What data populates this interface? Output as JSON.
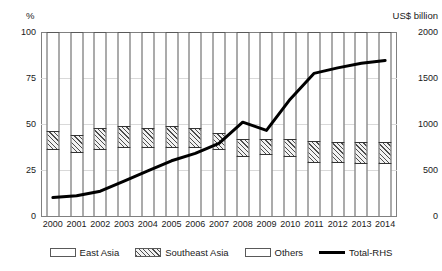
{
  "chart_data": {
    "type": "bar",
    "title": "",
    "subtitle": "",
    "xlabel": "",
    "ylabel": "%",
    "y2label": "US$ billion",
    "categories": [
      "2000",
      "2001",
      "2002",
      "2003",
      "2004",
      "2005",
      "2006",
      "2007",
      "2008",
      "2009",
      "2010",
      "2011",
      "2012",
      "2013",
      "2014"
    ],
    "ylim": [
      0,
      100
    ],
    "yticks": [
      "0",
      "25",
      "75",
      "50",
      "100"
    ],
    "y_ticks": [
      "0",
      "25",
      "50",
      "75",
      "100"
    ],
    "y2lim": [
      0,
      2000
    ],
    "y2_ticks": [
      "0",
      "500",
      "1000",
      "1500",
      "2000"
    ],
    "grid": true,
    "legend_position": "bottom",
    "series": [
      {
        "name": "East Asia",
        "axis": "left",
        "type": "bar-stacked",
        "unit": "%",
        "pattern": "stipple",
        "values": [
          36,
          34,
          36,
          37,
          37,
          37,
          37,
          36,
          32,
          33,
          32,
          29,
          29,
          28,
          28
        ]
      },
      {
        "name": "Southeast Asia",
        "axis": "left",
        "type": "bar-stacked",
        "unit": "%",
        "pattern": "diagonal-hatch",
        "values": [
          10,
          10,
          12,
          12,
          11,
          12,
          11,
          9,
          10,
          9,
          10,
          12,
          11,
          12,
          12
        ]
      },
      {
        "name": "Others",
        "axis": "left",
        "type": "bar-stacked",
        "unit": "%",
        "pattern": "solid-white",
        "values": [
          54,
          56,
          52,
          51,
          52,
          51,
          52,
          55,
          58,
          58,
          58,
          59,
          60,
          60,
          60
        ]
      },
      {
        "name": "Total-RHS",
        "axis": "right",
        "type": "line",
        "unit": "US$ billion",
        "color": "#000000",
        "values": [
          200,
          220,
          270,
          380,
          490,
          600,
          680,
          790,
          1020,
          930,
          1270,
          1550,
          1610,
          1660,
          1690
        ]
      }
    ]
  },
  "axes": {
    "left_title": "%",
    "right_title": "US$ billion"
  },
  "legend": {
    "items": [
      {
        "label": "East Asia",
        "swatch": "stipple-swatch"
      },
      {
        "label": "Southeast Asia",
        "swatch": "hatch-swatch"
      },
      {
        "label": "Others",
        "swatch": "white-swatch"
      },
      {
        "label": "Total-RHS",
        "swatch": "line-swatch"
      }
    ]
  },
  "colors": {
    "line": "#000000",
    "bar_outline": "#595959",
    "grid": "#d9d9d9",
    "axis": "#808080"
  }
}
